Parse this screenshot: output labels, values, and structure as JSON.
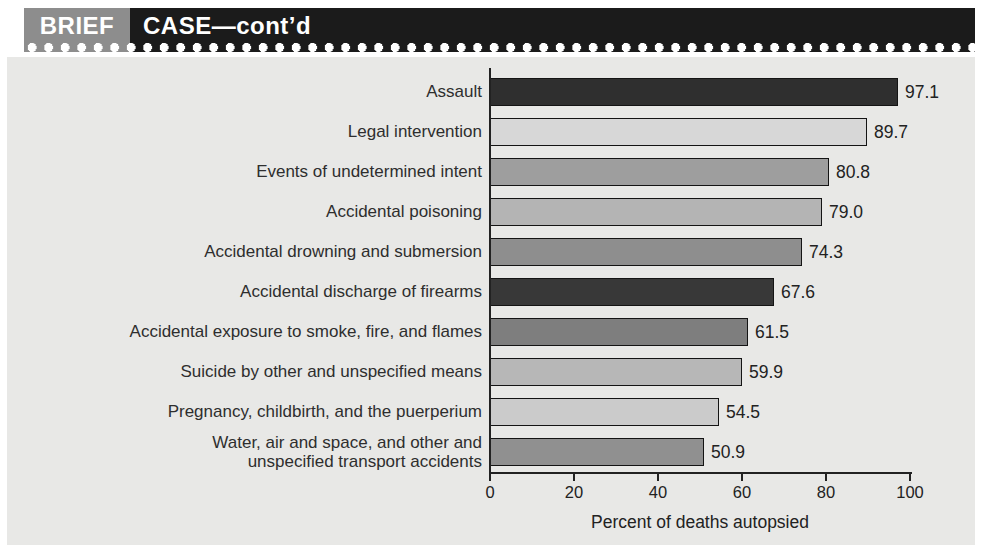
{
  "header": {
    "brief_label": "BRIEF",
    "case_label": "CASE—cont’d",
    "brief_bg": "#8d8d8d",
    "case_bg": "#1b1b1b",
    "text_color": "#ffffff"
  },
  "panel": {
    "bg_color": "#e8e8e6"
  },
  "chart_data": {
    "type": "bar",
    "orientation": "horizontal",
    "title": "",
    "xlabel": "Percent of deaths autopsied",
    "ylabel": "",
    "xlim": [
      0,
      100
    ],
    "xticks": [
      0,
      20,
      40,
      60,
      80,
      100
    ],
    "xtick_labels": [
      "0",
      "20",
      "40",
      "60",
      "80",
      "100"
    ],
    "grid": false,
    "legend": false,
    "categories": [
      "Assault",
      "Legal intervention",
      "Events of undetermined intent",
      "Accidental poisoning",
      "Accidental drowning and submersion",
      "Accidental discharge of firearms",
      "Accidental exposure to smoke, fire, and flames",
      "Suicide by other and unspecified means",
      "Pregnancy, childbirth, and the puerperium",
      "Water, air and space, and other and\nunspecified transport accidents"
    ],
    "values": [
      97.1,
      89.7,
      80.8,
      79.0,
      74.3,
      67.6,
      61.5,
      59.9,
      54.5,
      50.9
    ],
    "value_labels": [
      "97.1",
      "89.7",
      "80.8",
      "79.0",
      "74.3",
      "67.6",
      "61.5",
      "59.9",
      "54.5",
      "50.9"
    ],
    "bar_colors": [
      "#2f2f2f",
      "#d7d7d7",
      "#9e9e9e",
      "#b4b4b4",
      "#8e8e8e",
      "#383838",
      "#7e7e7e",
      "#b7b7b7",
      "#cbcbcb",
      "#909090"
    ],
    "bar_border_color": "#141414",
    "axis_color": "#222222"
  }
}
